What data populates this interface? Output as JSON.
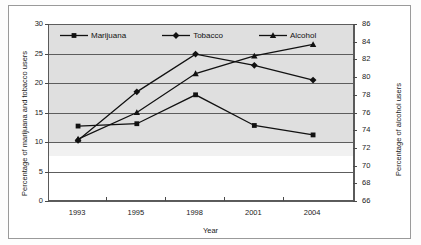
{
  "chart_data": {
    "type": "line",
    "title": "",
    "xlabel": "Year",
    "ylabel": "Percentage of marijuana and tobacco users",
    "ylabel_right": "Percentage of alcohol users",
    "categories": [
      "1993",
      "1995",
      "1998",
      "2001",
      "2004"
    ],
    "ylim": [
      0,
      30
    ],
    "yticks": [
      0,
      5,
      10,
      15,
      20,
      25,
      30
    ],
    "ylim_right": [
      66,
      86
    ],
    "yticks_right": [
      66,
      68,
      70,
      72,
      74,
      76,
      78,
      80,
      82,
      84,
      86
    ],
    "grid": true,
    "legend_position": "top-inside",
    "series": [
      {
        "name": "Marijuana",
        "marker": "square",
        "axis": "left",
        "values": [
          12.7,
          13.1,
          18.0,
          12.8,
          11.2
        ]
      },
      {
        "name": "Tobacco",
        "marker": "diamond",
        "axis": "left",
        "values": [
          10.3,
          18.5,
          24.9,
          23.0,
          20.5
        ]
      },
      {
        "name": "Alcohol",
        "marker": "triangle",
        "axis": "right",
        "values": [
          73.0,
          76.0,
          80.4,
          82.4,
          83.7
        ]
      }
    ],
    "colors": {
      "series_line": "#111111",
      "gridline": "#5d5d5d",
      "plot_background": "#d3d3d3",
      "axis": "#4a4a4a",
      "frame": "#9a9a9a"
    }
  },
  "axes": {
    "left": {
      "title": "Percentage of marijuana and tobacco users",
      "ticks": [
        "30",
        "25",
        "20",
        "15",
        "10",
        "5",
        "0"
      ]
    },
    "right": {
      "title": "Percentage of alcohol users",
      "ticks": [
        "86",
        "84",
        "82",
        "80",
        "78",
        "76",
        "74",
        "72",
        "70",
        "68",
        "66"
      ]
    },
    "bottom": {
      "title": "Year",
      "ticks": [
        "1993",
        "1995",
        "1998",
        "2001",
        "2004"
      ]
    }
  },
  "legend": {
    "items": [
      {
        "label": "Marijuana",
        "marker": "square-marker-icon"
      },
      {
        "label": "Tobacco",
        "marker": "diamond-marker-icon"
      },
      {
        "label": "Alcohol",
        "marker": "triangle-marker-icon"
      }
    ]
  }
}
